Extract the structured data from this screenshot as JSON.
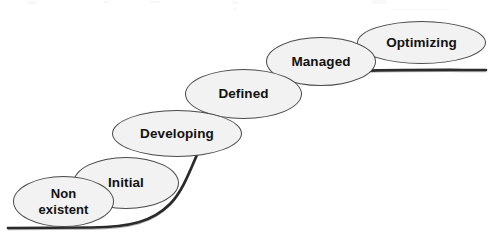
{
  "diagram": {
    "type": "s-curve-maturity-stages",
    "background_color": "#ffffff",
    "curve": {
      "name": "maturity-s-curve",
      "color": "#2b2b2b",
      "stroke_width": 2.6,
      "description": "Flat at lower left, steep rise in the middle, flattening at upper right"
    },
    "bubble_style": {
      "fill": "#f2f2f2",
      "border": "#4a4a4a",
      "text_color": "#111111"
    },
    "stages": [
      {
        "id": "non-existent",
        "label": "Non\nexistent",
        "order": 1
      },
      {
        "id": "initial",
        "label": "Initial",
        "order": 2
      },
      {
        "id": "developing",
        "label": "Developing",
        "order": 3
      },
      {
        "id": "defined",
        "label": "Defined",
        "order": 4
      },
      {
        "id": "managed",
        "label": "Managed",
        "order": 5
      },
      {
        "id": "optimizing",
        "label": "Optimizing",
        "order": 6
      }
    ]
  }
}
